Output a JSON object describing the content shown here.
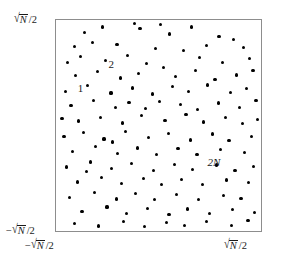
{
  "figure": {
    "name": "random-point-scatter-square",
    "background_color": "#ffffff",
    "frame_color": "#8d8d8d",
    "point_color": "#000000"
  },
  "axes": {
    "y_top_label": "√N̅/2",
    "y_bottom_label": "−√N̅/2",
    "x_left_label": "−√N̅/2",
    "x_right_label": "√N̅/2",
    "y_top_parts": {
      "prefix": "",
      "radical": "√",
      "radicand": "N",
      "suffix": "/2"
    },
    "y_bottom_parts": {
      "prefix": "−",
      "radical": "√",
      "radicand": "N",
      "suffix": "/2"
    },
    "x_left_parts": {
      "prefix": "−",
      "radical": "√",
      "radicand": "N",
      "suffix": "/2"
    },
    "x_right_parts": {
      "prefix": "",
      "radical": "√",
      "radicand": "N",
      "suffix": "/2"
    }
  },
  "annotations": [
    {
      "name": "point-label-1",
      "text": "1",
      "x_pct": 10.6,
      "y_pct": 30.0,
      "italic": false
    },
    {
      "name": "point-label-2",
      "text": "2",
      "x_pct": 25.6,
      "y_pct": 18.3,
      "italic": false
    },
    {
      "name": "point-label-2n",
      "text": "2N",
      "x_pct": 73.9,
      "y_pct": 64.8,
      "italic": true
    }
  ],
  "chart_data": {
    "type": "scatter",
    "title": "",
    "xlabel": "",
    "ylabel": "",
    "xlim": [
      -0.5,
      0.5
    ],
    "ylim": [
      -0.5,
      0.5
    ],
    "xtick_labels": [
      "−√N̅/2",
      "√N̅/2"
    ],
    "ytick_labels": [
      "−√N̅/2",
      "√N̅/2"
    ],
    "grid": false,
    "legend": null,
    "n_points": 132,
    "marker": "circle",
    "marker_size_px": 3.2,
    "note": "Uniformly random points in a square of side sqrt(N); labels mark particles 1, 2 and 2N.",
    "points_pct": [
      [
        14.0,
        6.1
      ],
      [
        22.7,
        3.3
      ],
      [
        38.3,
        1.8
      ],
      [
        55.5,
        6.6
      ],
      [
        66.2,
        3.3
      ],
      [
        79.5,
        8.0
      ],
      [
        8.9,
        12.7
      ],
      [
        17.9,
        10.8
      ],
      [
        29.8,
        11.6
      ],
      [
        48.5,
        13.6
      ],
      [
        62.0,
        14.6
      ],
      [
        73.3,
        12.2
      ],
      [
        86.6,
        9.4
      ],
      [
        91.5,
        13.1
      ],
      [
        5.8,
        20.2
      ],
      [
        12.1,
        17.4
      ],
      [
        24.2,
        19.2
      ],
      [
        34.7,
        17.0
      ],
      [
        44.0,
        20.5
      ],
      [
        52.4,
        22.4
      ],
      [
        70.0,
        17.9
      ],
      [
        81.2,
        20.0
      ],
      [
        94.3,
        18.3
      ],
      [
        9.7,
        26.3
      ],
      [
        20.3,
        24.6
      ],
      [
        31.6,
        27.5
      ],
      [
        40.1,
        25.4
      ],
      [
        58.3,
        26.8
      ],
      [
        67.9,
        23.9
      ],
      [
        77.6,
        28.2
      ],
      [
        88.0,
        26.1
      ],
      [
        96.1,
        24.0
      ],
      [
        4.8,
        33.8
      ],
      [
        15.5,
        31.0
      ],
      [
        26.8,
        34.6
      ],
      [
        37.2,
        32.2
      ],
      [
        46.9,
        35.1
      ],
      [
        56.7,
        31.7
      ],
      [
        64.8,
        33.9
      ],
      [
        74.0,
        30.8
      ],
      [
        85.1,
        34.3
      ],
      [
        93.0,
        32.6
      ],
      [
        7.3,
        40.6
      ],
      [
        18.2,
        38.2
      ],
      [
        28.9,
        41.3
      ],
      [
        35.6,
        39.0
      ],
      [
        43.5,
        42.1
      ],
      [
        50.3,
        38.6
      ],
      [
        60.9,
        40.2
      ],
      [
        69.2,
        42.6
      ],
      [
        79.1,
        39.3
      ],
      [
        89.5,
        41.4
      ],
      [
        97.6,
        38.1
      ],
      [
        11.0,
        47.9
      ],
      [
        21.9,
        46.1
      ],
      [
        32.4,
        48.8
      ],
      [
        41.7,
        45.3
      ],
      [
        53.2,
        47.6
      ],
      [
        63.4,
        44.8
      ],
      [
        72.1,
        48.3
      ],
      [
        82.6,
        46.4
      ],
      [
        90.8,
        49.0
      ],
      [
        3.9,
        55.3
      ],
      [
        13.6,
        53.2
      ],
      [
        23.4,
        56.4
      ],
      [
        33.8,
        52.9
      ],
      [
        45.1,
        55.8
      ],
      [
        54.9,
        53.6
      ],
      [
        65.7,
        56.9
      ],
      [
        76.3,
        54.0
      ],
      [
        84.4,
        57.1
      ],
      [
        95.2,
        55.4
      ],
      [
        8.2,
        62.4
      ],
      [
        19.4,
        60.1
      ],
      [
        30.1,
        63.2
      ],
      [
        39.6,
        60.7
      ],
      [
        49.2,
        63.6
      ],
      [
        59.5,
        61.0
      ],
      [
        68.8,
        63.8
      ],
      [
        80.4,
        61.5
      ],
      [
        92.1,
        62.9
      ],
      [
        5.3,
        69.7
      ],
      [
        16.7,
        67.3
      ],
      [
        27.2,
        70.4
      ],
      [
        36.9,
        68.0
      ],
      [
        47.6,
        71.2
      ],
      [
        57.8,
        68.4
      ],
      [
        66.5,
        70.9
      ],
      [
        78.2,
        68.7
      ],
      [
        87.3,
        71.3
      ],
      [
        96.5,
        69.5
      ],
      [
        10.4,
        76.8
      ],
      [
        22.1,
        74.5
      ],
      [
        31.9,
        77.6
      ],
      [
        42.8,
        75.1
      ],
      [
        51.6,
        78.0
      ],
      [
        61.3,
        75.5
      ],
      [
        71.4,
        77.9
      ],
      [
        83.0,
        75.8
      ],
      [
        94.0,
        77.2
      ],
      [
        6.6,
        84.0
      ],
      [
        18.8,
        81.7
      ],
      [
        29.4,
        84.8
      ],
      [
        38.9,
        82.3
      ],
      [
        48.1,
        85.2
      ],
      [
        58.6,
        82.7
      ],
      [
        69.7,
        85.0
      ],
      [
        81.8,
        83.0
      ],
      [
        90.2,
        84.6
      ],
      [
        12.7,
        90.9
      ],
      [
        24.9,
        88.6
      ],
      [
        34.2,
        91.6
      ],
      [
        44.6,
        89.2
      ],
      [
        55.1,
        92.1
      ],
      [
        64.1,
        89.6
      ],
      [
        75.0,
        91.8
      ],
      [
        86.0,
        89.9
      ],
      [
        97.0,
        91.2
      ],
      [
        9.1,
        96.3
      ],
      [
        20.8,
        97.6
      ],
      [
        33.1,
        95.4
      ],
      [
        43.2,
        97.9
      ],
      [
        53.9,
        95.8
      ],
      [
        62.7,
        97.4
      ],
      [
        73.6,
        95.6
      ],
      [
        85.6,
        97.3
      ],
      [
        93.7,
        95.1
      ],
      [
        2.9,
        46.5
      ],
      [
        98.3,
        47.2
      ],
      [
        50.9,
        2.2
      ],
      [
        41.0,
        3.9
      ],
      [
        27.6,
        57.8
      ],
      [
        15.0,
        71.9
      ]
    ]
  }
}
